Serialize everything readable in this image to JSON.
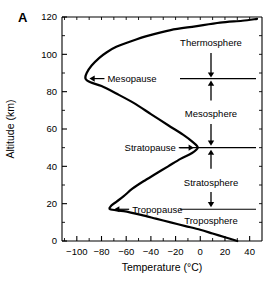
{
  "panel": {
    "label": "A"
  },
  "chart_data": {
    "type": "line",
    "title": "",
    "xlabel": "Temperature (°C)",
    "ylabel": "Altitude (km)",
    "xlim": [
      -112,
      50
    ],
    "ylim": [
      0,
      120
    ],
    "grid": false,
    "legend": "none",
    "x_ticks": [
      -100,
      -80,
      -60,
      -40,
      -20,
      0,
      20,
      40
    ],
    "x_tick_labels": [
      "−100",
      "−80",
      "−60",
      "−40",
      "−20",
      "0",
      "20",
      "40"
    ],
    "x_minor_ticks": [
      -110,
      -90,
      -70,
      -50,
      -30,
      -10,
      10,
      30,
      50
    ],
    "y_ticks": [
      0,
      20,
      40,
      60,
      80,
      100,
      120
    ],
    "y_tick_labels": [
      "0",
      "20",
      "40",
      "60",
      "80",
      "100",
      "120"
    ],
    "y_minor_ticks": [
      10,
      30,
      50,
      70,
      90,
      110
    ],
    "series": [
      {
        "name": "Standard atmosphere temperature profile",
        "x_label": "Temperature (°C)",
        "y_label": "Altitude (km)",
        "points": [
          [
            30,
            0
          ],
          [
            20,
            2
          ],
          [
            10,
            4
          ],
          [
            0,
            6
          ],
          [
            -12,
            8
          ],
          [
            -24,
            10
          ],
          [
            -36,
            12
          ],
          [
            -48,
            14
          ],
          [
            -62,
            16
          ],
          [
            -73,
            17
          ],
          [
            -72,
            19
          ],
          [
            -68,
            21
          ],
          [
            -62,
            24
          ],
          [
            -55,
            28
          ],
          [
            -46,
            32
          ],
          [
            -36,
            36
          ],
          [
            -26,
            40
          ],
          [
            -16,
            44
          ],
          [
            -7,
            47
          ],
          [
            -2,
            50
          ],
          [
            -6,
            53
          ],
          [
            -14,
            57
          ],
          [
            -26,
            62
          ],
          [
            -40,
            68
          ],
          [
            -54,
            74
          ],
          [
            -68,
            79
          ],
          [
            -80,
            83
          ],
          [
            -89,
            85
          ],
          [
            -93,
            87
          ],
          [
            -92,
            90
          ],
          [
            -88,
            94
          ],
          [
            -82,
            98
          ],
          [
            -76,
            101
          ],
          [
            -68,
            104
          ],
          [
            -56,
            107
          ],
          [
            -42,
            110
          ],
          [
            -24,
            113
          ],
          [
            -4,
            115
          ],
          [
            16,
            117
          ],
          [
            34,
            118
          ],
          [
            46,
            119
          ]
        ]
      }
    ],
    "annotations": [
      {
        "name": "mesopause",
        "label": "Mesopause",
        "altitude_km": 87,
        "temperature_c": -93,
        "arrow": "left"
      },
      {
        "name": "stratopause",
        "label": "Stratopause",
        "altitude_km": 50,
        "temperature_c": -2,
        "arrow": "right"
      },
      {
        "name": "tropopause",
        "label": "Tropopause",
        "altitude_km": 17,
        "temperature_c": -73,
        "arrow": "left"
      }
    ],
    "layers": [
      {
        "name": "thermosphere",
        "label": "Thermosphere",
        "lower_boundary_km": 87,
        "upper_boundary_km": 120
      },
      {
        "name": "mesosphere",
        "label": "Mesosphere",
        "lower_boundary_km": 50,
        "upper_boundary_km": 87
      },
      {
        "name": "stratosphere",
        "label": "Stratosphere",
        "lower_boundary_km": 17,
        "upper_boundary_km": 50
      },
      {
        "name": "troposphere",
        "label": "Troposphere",
        "lower_boundary_km": 0,
        "upper_boundary_km": 17
      }
    ],
    "boundary_lines": [
      {
        "name": "mesopause-divider",
        "altitude_km": 87
      },
      {
        "name": "stratopause-divider",
        "altitude_km": 50
      },
      {
        "name": "tropopause-divider",
        "altitude_km": 17
      }
    ]
  }
}
